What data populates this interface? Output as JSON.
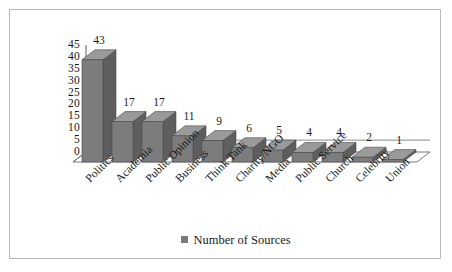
{
  "chart_data": {
    "type": "bar",
    "title": "",
    "subtitle": "",
    "xlabel": "",
    "ylabel": "",
    "categories": [
      "Politics",
      "Academia",
      "Public Opinion",
      "Business",
      "Think Tank",
      "Charity/NGO",
      "Media",
      "Public Service",
      "Church",
      "Celebrity",
      "Union"
    ],
    "values": [
      43,
      17,
      17,
      11,
      9,
      6,
      5,
      4,
      4,
      2,
      1
    ],
    "data_labels": [
      "43",
      "17",
      "17",
      "11",
      "9",
      "6",
      "5",
      "4",
      "4",
      "2",
      "1"
    ],
    "series": [
      {
        "name": "Number of Sources",
        "values": [
          43,
          17,
          17,
          11,
          9,
          6,
          5,
          4,
          4,
          2,
          1
        ]
      }
    ],
    "ylim": [
      0,
      45
    ],
    "ytick_values": [
      45,
      40,
      35,
      30,
      25,
      20,
      15,
      10,
      5,
      0
    ],
    "ytick_labels": [
      "45",
      "40",
      "35",
      "30",
      "25",
      "20",
      "15",
      "10",
      "5",
      "0"
    ],
    "grid": false,
    "style": "3d-column",
    "legend": {
      "position": "bottom",
      "entries": [
        "Number of Sources"
      ]
    },
    "colors": {
      "bar_front": "#7c7c7c",
      "bar_top": "#9a9a9a",
      "bar_side": "#5e5e5e",
      "floor": "#fbfbfb",
      "axis": "#6b6b6b",
      "text": "#1a1a1a",
      "frame": "#b9b9b9"
    }
  }
}
